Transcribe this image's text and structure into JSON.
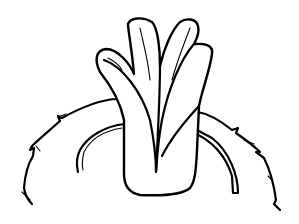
{
  "image": {
    "description": "Black line drawing of a plant sprout with leaves emerging from a thick stalk, surrounded by a wavy ring and an inner arc",
    "background": "#ffffff",
    "stroke_color": "#000000"
  }
}
